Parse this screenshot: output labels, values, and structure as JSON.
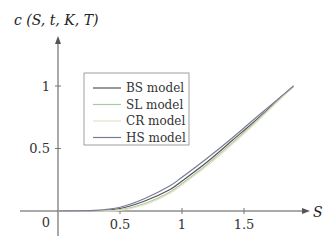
{
  "chart_data": {
    "type": "line",
    "title": "",
    "xlabel": "S",
    "ylabel": "c(S,t,K,T)",
    "xlim": [
      -0.3,
      2.2
    ],
    "ylim": [
      -0.15,
      1.35
    ],
    "x_ticks": [
      "0.5",
      "1",
      "1.5"
    ],
    "y_ticks": [
      "0.5",
      "1"
    ],
    "origin_label": "0",
    "grid": false,
    "legend_position": "upper-left-inside",
    "x": [
      0.0,
      0.3,
      0.5,
      0.7,
      0.9,
      1.0,
      1.2,
      1.4,
      1.6,
      1.9
    ],
    "series": [
      {
        "name": "BS model",
        "color": "#555555",
        "values": [
          0,
          0.0,
          0.02,
          0.08,
          0.17,
          0.24,
          0.39,
          0.56,
          0.73,
          1.0
        ]
      },
      {
        "name": "SL model",
        "color": "#a8c8a8",
        "values": [
          0,
          0.0,
          0.01,
          0.06,
          0.15,
          0.22,
          0.37,
          0.54,
          0.72,
          1.0
        ]
      },
      {
        "name": "CR model",
        "color": "#e3e3c0",
        "values": [
          0,
          0.0,
          0.005,
          0.05,
          0.14,
          0.21,
          0.36,
          0.53,
          0.71,
          1.0
        ]
      },
      {
        "name": "HS model",
        "color": "#7a7a9a",
        "values": [
          0,
          0.005,
          0.03,
          0.1,
          0.2,
          0.27,
          0.42,
          0.58,
          0.75,
          1.0
        ]
      }
    ]
  },
  "axes": {
    "x_label": "S",
    "y_label": "c (S, t, K, T)",
    "origin": "0",
    "x_tick_labels": [
      "0.5",
      "1",
      "1.5"
    ],
    "y_tick_labels": [
      "0.5",
      "1"
    ]
  },
  "legend": {
    "items": [
      "BS model",
      "SL model",
      "CR model",
      "HS model"
    ]
  }
}
